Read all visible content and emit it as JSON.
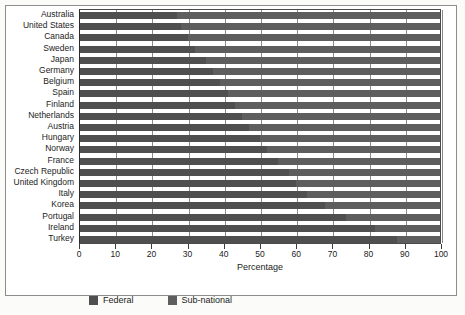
{
  "chart_data": {
    "type": "bar",
    "orientation": "horizontal",
    "stacked": true,
    "title": "",
    "xlabel": "Percentage",
    "ylabel": "",
    "xlim": [
      0,
      100
    ],
    "xticks": [
      0,
      10,
      20,
      30,
      40,
      50,
      60,
      70,
      80,
      90,
      100
    ],
    "xticklabels": [
      "0",
      "10",
      "20",
      "30",
      "40",
      "50",
      "60",
      "70",
      "80",
      "90",
      "100"
    ],
    "grid": true,
    "grid_axis": "x",
    "legend_position": "bottom-left",
    "categories": [
      "Australia",
      "United States",
      "Canada",
      "Sweden",
      "Japan",
      "Germany",
      "Belgium",
      "Spain",
      "Finland",
      "Netherlands",
      "Austria",
      "Hungary",
      "Norway",
      "France",
      "Czech Republic",
      "United Kingdom",
      "Italy",
      "Korea",
      "Portugal",
      "Ireland",
      "Turkey"
    ],
    "series": [
      {
        "name": "Federal",
        "color": "#4f4f4f",
        "values": [
          27,
          28,
          30,
          32,
          35,
          37,
          39,
          41,
          43,
          45,
          47,
          50,
          52,
          55,
          58,
          60,
          63,
          68,
          74,
          82,
          88
        ]
      },
      {
        "name": "Sub-national",
        "color": "#5e5e5e",
        "values": [
          73,
          72,
          70,
          68,
          65,
          63,
          61,
          59,
          57,
          55,
          53,
          50,
          48,
          45,
          42,
          40,
          37,
          32,
          26,
          18,
          12
        ]
      }
    ]
  },
  "legend": {
    "items": [
      {
        "label": "Federal",
        "swatch": "federal"
      },
      {
        "label": "Sub-national",
        "swatch": "sub"
      }
    ]
  },
  "axis": {
    "x_title": "Percentage"
  },
  "colors": {
    "federal": "#4f4f4f",
    "sub_national": "#5e5e5e",
    "grid": "#8a8a8a",
    "axis": "#2b2b2b",
    "text": "#1c1c1c",
    "page_background": "#fbfbf9"
  }
}
